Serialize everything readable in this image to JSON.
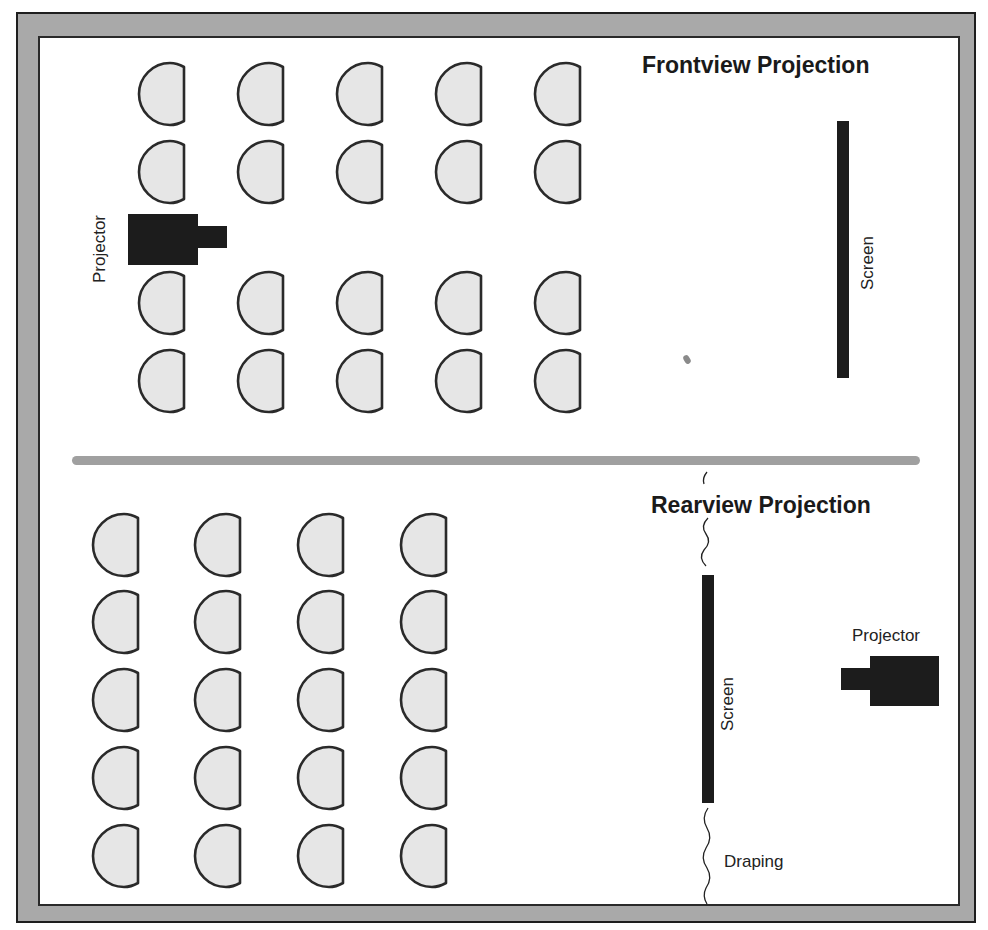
{
  "diagram": {
    "type": "room-layout",
    "colors": {
      "frame": "#a9a9a9",
      "frame_outline": "#1e1e1e",
      "seat_fill": "#e6e6e6",
      "seat_outline": "#2a2a2a",
      "equipment": "#1c1c1c",
      "divider": "#a0a0a0"
    },
    "front": {
      "title": "Frontview Projection",
      "projector_label": "Projector",
      "screen_label": "Screen",
      "seat_rows": 4,
      "seat_cols": 5
    },
    "rear": {
      "title": "Rearview Projection",
      "projector_label": "Projector",
      "screen_label": "Screen",
      "draping_label": "Draping",
      "seat_rows": 5,
      "seat_cols": 4
    }
  }
}
